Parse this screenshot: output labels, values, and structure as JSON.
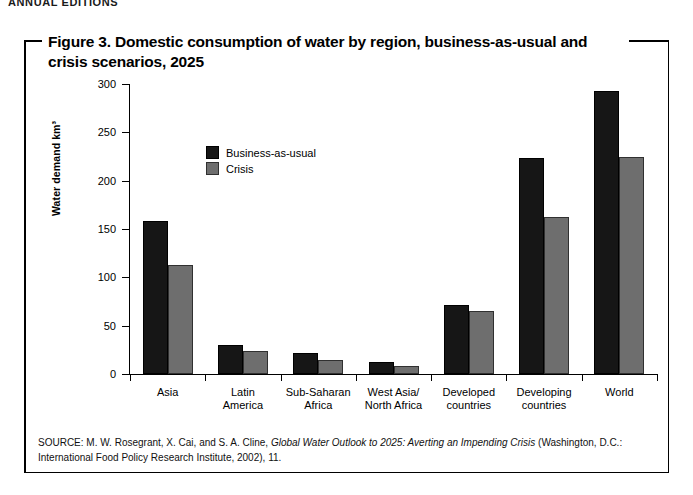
{
  "page": {
    "running_header": "ANNUAL EDITIONS"
  },
  "figure": {
    "title": "Figure 3. Domestic consumption of water by region, business-as-usual and crisis scenarios, 2025",
    "source_prefix": "SOURCE: M. W. Rosegrant, X. Cai, and S. A. Cline, ",
    "source_italic": "Global Water Outlook to 2025: Averting an Impending Crisis",
    "source_suffix": " (Washington, D.C.: International Food Policy Research Institute, 2002), 11."
  },
  "chart_data": {
    "type": "bar",
    "title": "Domestic consumption of water by region, business-as-usual and crisis scenarios, 2025",
    "xlabel": "",
    "ylabel": "Water demand km³",
    "ylim": [
      0,
      300
    ],
    "yticks": [
      0,
      50,
      100,
      150,
      200,
      250,
      300
    ],
    "grid": false,
    "legend_position": "inside upper-left",
    "categories": [
      "Asia",
      "Latin America",
      "Sub-Saharan Africa",
      "West Asia/North Africa",
      "Developed countries",
      "Developing countries",
      "World"
    ],
    "category_lines": [
      [
        "Asia"
      ],
      [
        "Latin",
        "America"
      ],
      [
        "Sub-Saharan",
        "Africa"
      ],
      [
        "West Asia/",
        "North Africa"
      ],
      [
        "Developed",
        "countries"
      ],
      [
        "Developing",
        "countries"
      ],
      [
        "World"
      ]
    ],
    "series": [
      {
        "name": "Business-as-usual",
        "color": "#161616",
        "values": [
          158,
          30,
          22,
          12,
          71,
          223,
          293
        ]
      },
      {
        "name": "Crisis",
        "color": "#6e6e6e",
        "values": [
          113,
          24,
          14,
          8,
          65,
          162,
          225
        ]
      }
    ]
  }
}
